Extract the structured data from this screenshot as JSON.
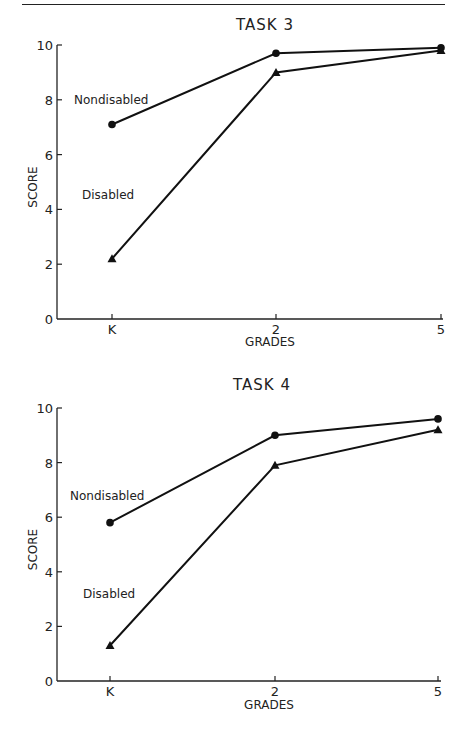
{
  "chart_data": [
    {
      "type": "line",
      "title": "TASK 3",
      "xlabel": "GRADES",
      "ylabel": "SCORE",
      "categories": [
        "K",
        "2",
        "5"
      ],
      "yticks": [
        "0",
        "2",
        "4",
        "6",
        "8",
        "10"
      ],
      "ylim": [
        0,
        10
      ],
      "grid": false,
      "series": [
        {
          "name": "Nondisabled",
          "marker": "circle",
          "values": [
            7.1,
            9.7,
            9.9
          ]
        },
        {
          "name": "Disabled",
          "marker": "triangle",
          "values": [
            2.2,
            9.0,
            9.8
          ]
        }
      ]
    },
    {
      "type": "line",
      "title": "TASK 4",
      "xlabel": "GRADES",
      "ylabel": "SCORE",
      "categories": [
        "K",
        "2",
        "5"
      ],
      "yticks": [
        "0",
        "2",
        "4",
        "6",
        "8",
        "10"
      ],
      "ylim": [
        0,
        10
      ],
      "grid": false,
      "series": [
        {
          "name": "Nondisabled",
          "marker": "circle",
          "values": [
            5.8,
            9.0,
            9.6
          ]
        },
        {
          "name": "Disabled",
          "marker": "triangle",
          "values": [
            1.3,
            7.9,
            9.2
          ]
        }
      ]
    }
  ]
}
